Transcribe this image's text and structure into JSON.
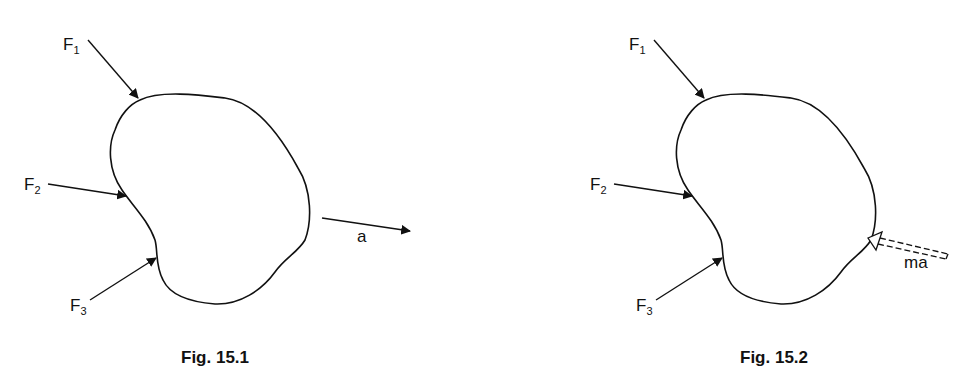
{
  "figures": [
    {
      "caption": "Fig. 15.1",
      "labels": {
        "f1": {
          "main": "F",
          "sub": "1"
        },
        "f2": {
          "main": "F",
          "sub": "2"
        },
        "f3": {
          "main": "F",
          "sub": "3"
        },
        "accel": "a"
      }
    },
    {
      "caption": "Fig. 15.2",
      "labels": {
        "f1": {
          "main": "F",
          "sub": "1"
        },
        "f2": {
          "main": "F",
          "sub": "2"
        },
        "f3": {
          "main": "F",
          "sub": "3"
        },
        "inertia": "ma"
      }
    }
  ],
  "colors": {
    "stroke": "#111111",
    "background": "#ffffff"
  }
}
